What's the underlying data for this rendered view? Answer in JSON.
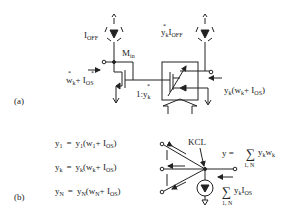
{
  "panel_a": {
    "label": "(a)",
    "ioff_left": "I",
    "ioff_left_sub": "OFF",
    "ioff_right_coef": "y",
    "ioff_right_coef_sub": "k",
    "ioff_right": "I",
    "ioff_right_sub": "OFF",
    "transistor_label": "M",
    "transistor_label_sub": "in",
    "input_w": "w",
    "input_w_sub": "k",
    "input_plus": "+ I",
    "input_os_sub": "OS",
    "ratio": "1:y",
    "ratio_sub": "k",
    "output_y": "y",
    "output_y_sub": "k",
    "output_paren": "(w",
    "output_w_sub": "k",
    "output_plus": "+ I",
    "output_os_sub": "OS",
    "output_close": ")",
    "star": "*"
  },
  "panel_b": {
    "label": "(b)",
    "equations": [
      {
        "lhs": "y",
        "lhs_sub": "1",
        "eq": "=",
        "y": "y",
        "y_sub": "1",
        "w": "(w",
        "w_sub": "1",
        "plus": "+ I",
        "os_sub": "OS",
        "close": ")"
      },
      {
        "lhs": "y",
        "lhs_sub": "k",
        "eq": "=",
        "y": "y",
        "y_sub": "k",
        "w": "(w",
        "w_sub": "k",
        "plus": "+ I",
        "os_sub": "OS",
        "close": ")"
      },
      {
        "lhs": "y",
        "lhs_sub": "N",
        "eq": "=",
        "y": "y",
        "y_sub": "N",
        "w": "(w",
        "w_sub": "N",
        "plus": "+ I",
        "os_sub": "OS",
        "close": ")"
      }
    ],
    "kcl_label": "KCL",
    "sum_output": {
      "lhs": "y =",
      "sigma": "∑",
      "range": "1, N",
      "term_y": "y",
      "term_y_sub": "k",
      "term_w": "w",
      "term_w_sub": "k"
    },
    "sum_offset": {
      "sigma": "∑",
      "range": "1, N",
      "term_y": "y",
      "term_y_sub": "k",
      "term_i": "I",
      "term_i_sub": "OS"
    }
  }
}
